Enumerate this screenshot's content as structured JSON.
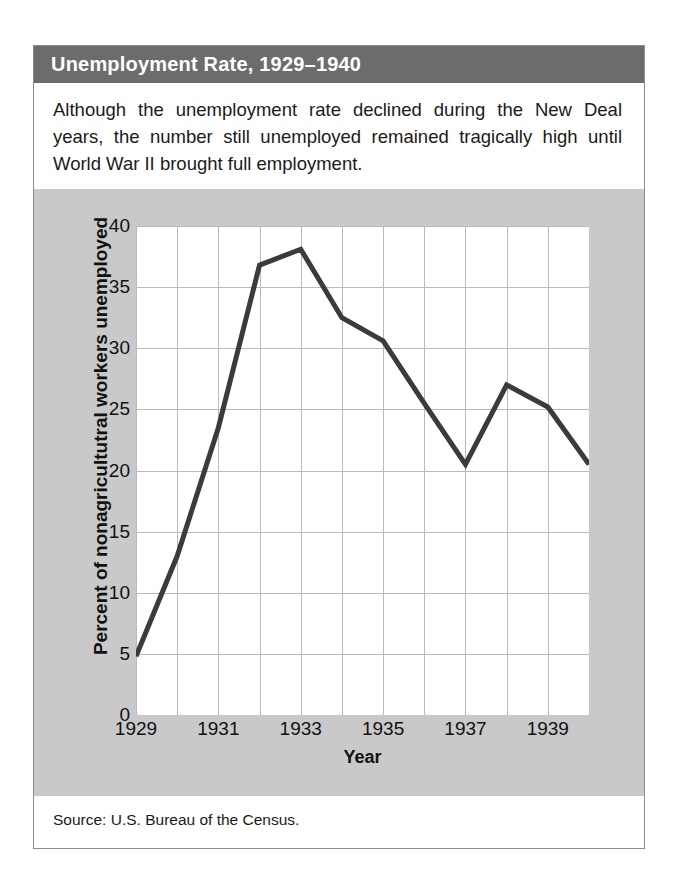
{
  "figure": {
    "title": "Unemployment Rate, 1929–1940",
    "caption": "Although the unemployment rate declined during the New Deal years, the number still unemployed remained tragically high until World War II brought full employment.",
    "source": "Source: U.S. Bureau of the Census."
  },
  "colors": {
    "banner": "#6c6c6c",
    "banner_text": "#ffffff",
    "panel_background": "#c9c9c9",
    "plot_background": "#ffffff",
    "gridline": "#b9b9b9",
    "line": "#3b3b3b",
    "text": "#111111",
    "frame_border": "#8d8d8d"
  },
  "chart_data": {
    "type": "line",
    "title": "Unemployment Rate, 1929–1940",
    "xlabel": "Year",
    "ylabel": "Percent of nonagricultutral workers unemployed",
    "x": [
      1929,
      1930,
      1931,
      1932,
      1933,
      1934,
      1935,
      1936,
      1937,
      1938,
      1939,
      1940
    ],
    "values": [
      4.8,
      13.0,
      23.5,
      36.8,
      38.1,
      32.5,
      30.6,
      25.5,
      20.5,
      27.0,
      25.2,
      20.5
    ],
    "series": [
      {
        "name": "Percent of nonagricultutral workers unemployed",
        "values": [
          4.8,
          13.0,
          23.5,
          36.8,
          38.1,
          32.5,
          30.6,
          25.5,
          20.5,
          27.0,
          25.2,
          20.5
        ]
      }
    ],
    "xlim": [
      1929,
      1940
    ],
    "ylim": [
      0,
      40
    ],
    "ytick_labels": [
      "0",
      "5",
      "10",
      "15",
      "20",
      "25",
      "30",
      "35",
      "40"
    ],
    "ytick_values": [
      0,
      5,
      10,
      15,
      20,
      25,
      30,
      35,
      40
    ],
    "xtick_labels": [
      "1929",
      "1931",
      "1933",
      "1935",
      "1937",
      "1939"
    ],
    "xtick_values": [
      1929,
      1931,
      1933,
      1935,
      1937,
      1939
    ],
    "xtick_minor_values": [
      1930,
      1932,
      1934,
      1936,
      1938,
      1940
    ],
    "grid": true,
    "legend": false,
    "line_width": 5
  }
}
